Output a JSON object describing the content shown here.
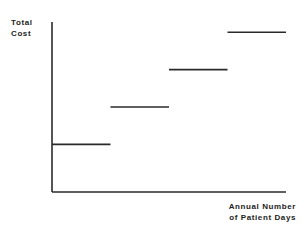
{
  "chart_data": {
    "type": "line",
    "subtype": "step-function (fixed cost steps)",
    "title": "",
    "ylabel": "Total Cost",
    "ylabel_lines": [
      "Total",
      "Cost"
    ],
    "xlabel": "Annual Number of Patient Days",
    "xlabel_lines": [
      "Annual Number",
      "of Patient Days"
    ],
    "grid": false,
    "legend": null,
    "axis_ticks": false,
    "xlim": [
      0,
      4
    ],
    "ylim": [
      0,
      5
    ],
    "series": [
      {
        "name": "Total Cost",
        "segments": [
          {
            "x_start": 0,
            "x_end": 1,
            "y": 1.4
          },
          {
            "x_start": 1,
            "x_end": 2,
            "y": 2.5
          },
          {
            "x_start": 2,
            "x_end": 3,
            "y": 3.6
          },
          {
            "x_start": 3,
            "x_end": 4,
            "y": 4.7
          }
        ]
      }
    ],
    "line_color": "#2a2a2a"
  },
  "labels": {
    "y_line1": "Total",
    "y_line2": "Cost",
    "x_line1": "Annual Number",
    "x_line2": "of Patient Days"
  }
}
